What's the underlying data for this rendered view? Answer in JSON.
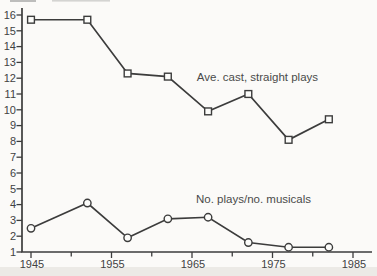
{
  "chart_data": {
    "type": "line",
    "title": "",
    "xlabel": "",
    "ylabel": "",
    "xlim": [
      1945,
      1985
    ],
    "ylim": [
      1,
      16
    ],
    "grid": false,
    "legend_position": "inline-annotations",
    "x_ticks": [
      1945,
      1950,
      1955,
      1960,
      1965,
      1970,
      1975,
      1980,
      1985
    ],
    "x_tick_labels": [
      "1945",
      "",
      "1955",
      "",
      "1965",
      "",
      "1975",
      "",
      "1985"
    ],
    "y_ticks": [
      1,
      2,
      3,
      4,
      5,
      6,
      7,
      8,
      9,
      10,
      11,
      12,
      13,
      14,
      15,
      16
    ],
    "y_tick_labels": [
      "1",
      "2",
      "3",
      "4",
      "5",
      "6",
      "7",
      "8",
      "9",
      "10",
      "11",
      "12",
      "13",
      "14",
      "15",
      "16"
    ],
    "x": [
      1945,
      1952,
      1957,
      1962,
      1967,
      1972,
      1977,
      1982
    ],
    "series": [
      {
        "name": "Ave. cast, straight plays",
        "marker": "square",
        "values": [
          15.7,
          15.7,
          12.3,
          12.1,
          9.9,
          11.0,
          8.1,
          9.4
        ],
        "label_pos": {
          "x": 1965.6,
          "y": 11.8
        }
      },
      {
        "name": "No. plays/no. musicals",
        "marker": "circle",
        "values": [
          2.5,
          4.1,
          1.9,
          3.1,
          3.2,
          1.6,
          1.3,
          1.3
        ],
        "label_pos": {
          "x": 1965.5,
          "y": 4.1
        }
      }
    ]
  },
  "colors": {
    "paper": "#fbfaf8",
    "paper_edge": "#eceae6",
    "ink": "#3c3c3c",
    "text": "#424242",
    "annotation_text": "#4a4a4a",
    "marker_fill": "#fcfcfa",
    "artifact": "#8b8b8b"
  }
}
